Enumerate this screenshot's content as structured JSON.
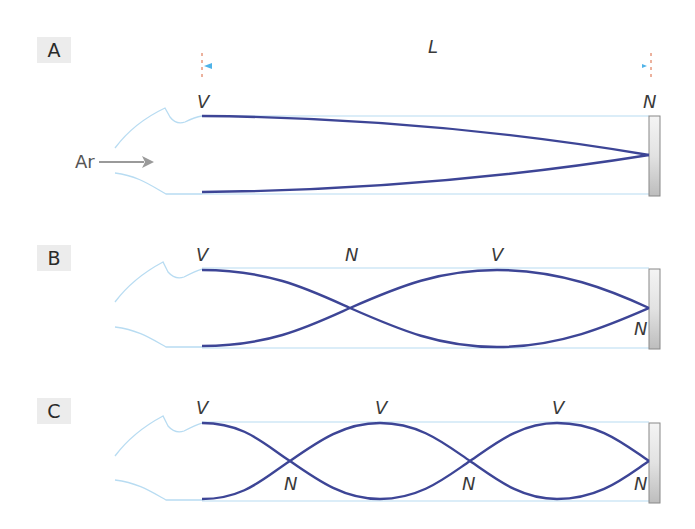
{
  "panels": [
    {
      "label": "A",
      "length_label": "L",
      "air_label": "Ar",
      "top_labels": [
        "V",
        "N"
      ],
      "bottom_labels": []
    },
    {
      "label": "B",
      "top_labels": [
        "V",
        "N",
        "V"
      ],
      "end_label": "N"
    },
    {
      "label": "C",
      "top_labels": [
        "V",
        "V",
        "V"
      ],
      "bottom_labels": [
        "N",
        "N",
        "N"
      ]
    }
  ],
  "colors": {
    "wave": "#3d4596",
    "tube_outline": "#b8dcf2",
    "length_arrow": "#4fb3e8",
    "air_arrow": "#9a9a9a",
    "dash_marker": "#d9643c",
    "label_bg": "#ececec"
  }
}
